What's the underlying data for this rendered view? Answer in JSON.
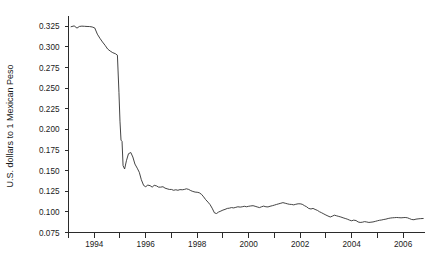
{
  "chart_data": {
    "type": "line",
    "title": "",
    "xlabel": "",
    "ylabel": "U.S. dollars to 1 Mexican Peso",
    "xlim": [
      1993.0,
      2006.85
    ],
    "ylim": [
      0.075,
      0.3375
    ],
    "grid": false,
    "legend": "none",
    "x_ticks": [
      1994,
      1996,
      1998,
      2000,
      2002,
      2004,
      2006
    ],
    "x_tick_labels": [
      "1994",
      "1996",
      "1998",
      "2000",
      "2002",
      "2004",
      "2006"
    ],
    "x_minor_ticks": [
      1993,
      1995,
      1997,
      1999,
      2001,
      2003,
      2005
    ],
    "y_ticks": [
      0.075,
      0.1,
      0.125,
      0.15,
      0.175,
      0.2,
      0.225,
      0.25,
      0.275,
      0.3,
      0.325
    ],
    "y_tick_labels": [
      "0.075",
      "0.100",
      "0.125",
      "0.150",
      "0.175",
      "0.200",
      "0.225",
      "0.250",
      "0.275",
      "0.300",
      "0.325"
    ],
    "line_color": "#2f2f2f",
    "series": [
      {
        "name": "USD per Mexican Peso",
        "x": [
          1993.1,
          1993.22,
          1993.33,
          1993.42,
          1993.52,
          1993.62,
          1993.72,
          1993.82,
          1993.92,
          1994.02,
          1994.12,
          1994.22,
          1994.32,
          1994.42,
          1994.52,
          1994.62,
          1994.72,
          1994.82,
          1994.9,
          1994.96,
          1995.0,
          1995.04,
          1995.08,
          1995.12,
          1995.18,
          1995.25,
          1995.33,
          1995.42,
          1995.5,
          1995.58,
          1995.67,
          1995.75,
          1995.83,
          1995.92,
          1996.0,
          1996.08,
          1996.17,
          1996.25,
          1996.33,
          1996.42,
          1996.5,
          1996.58,
          1996.67,
          1996.75,
          1996.83,
          1996.92,
          1997.0,
          1997.08,
          1997.17,
          1997.25,
          1997.33,
          1997.42,
          1997.5,
          1997.58,
          1997.67,
          1997.75,
          1997.83,
          1997.92,
          1998.0,
          1998.08,
          1998.17,
          1998.25,
          1998.33,
          1998.42,
          1998.5,
          1998.58,
          1998.67,
          1998.75,
          1998.83,
          1998.92,
          1999.0,
          1999.08,
          1999.17,
          1999.25,
          1999.33,
          1999.42,
          1999.5,
          1999.58,
          1999.67,
          1999.75,
          1999.83,
          1999.92,
          2000.0,
          2000.08,
          2000.17,
          2000.25,
          2000.33,
          2000.42,
          2000.5,
          2000.58,
          2000.67,
          2000.75,
          2000.83,
          2000.92,
          2001.0,
          2001.08,
          2001.17,
          2001.25,
          2001.33,
          2001.42,
          2001.5,
          2001.58,
          2001.67,
          2001.75,
          2001.83,
          2001.92,
          2002.0,
          2002.08,
          2002.17,
          2002.25,
          2002.33,
          2002.42,
          2002.5,
          2002.58,
          2002.67,
          2002.75,
          2002.83,
          2002.92,
          2003.0,
          2003.08,
          2003.17,
          2003.25,
          2003.33,
          2003.42,
          2003.5,
          2003.58,
          2003.67,
          2003.75,
          2003.83,
          2003.92,
          2004.0,
          2004.08,
          2004.17,
          2004.25,
          2004.33,
          2004.42,
          2004.5,
          2004.58,
          2004.67,
          2004.75,
          2004.83,
          2004.92,
          2005.0,
          2005.08,
          2005.17,
          2005.25,
          2005.33,
          2005.42,
          2005.5,
          2005.58,
          2005.67,
          2005.75,
          2005.83,
          2005.92,
          2006.0,
          2006.08,
          2006.17,
          2006.25,
          2006.33,
          2006.42,
          2006.5,
          2006.58,
          2006.67,
          2006.78
        ],
        "y": [
          0.3245,
          0.3255,
          0.3228,
          0.3248,
          0.3252,
          0.325,
          0.3248,
          0.3247,
          0.3242,
          0.323,
          0.3155,
          0.3105,
          0.306,
          0.302,
          0.2975,
          0.295,
          0.293,
          0.2918,
          0.29,
          0.245,
          0.21,
          0.187,
          0.1855,
          0.156,
          0.152,
          0.162,
          0.1705,
          0.172,
          0.1665,
          0.158,
          0.153,
          0.148,
          0.139,
          0.132,
          0.1305,
          0.1325,
          0.1318,
          0.13,
          0.1322,
          0.1315,
          0.13,
          0.13,
          0.1305,
          0.1288,
          0.128,
          0.1272,
          0.1272,
          0.1262,
          0.1268,
          0.1262,
          0.127,
          0.1268,
          0.1272,
          0.128,
          0.1272,
          0.1258,
          0.1248,
          0.124,
          0.1238,
          0.1232,
          0.1212,
          0.1182,
          0.1148,
          0.1118,
          0.1088,
          0.1045,
          0.0988,
          0.098,
          0.0998,
          0.101,
          0.1022,
          0.103,
          0.1042,
          0.1045,
          0.1052,
          0.1048,
          0.1055,
          0.1062,
          0.1058,
          0.1062,
          0.1068,
          0.1062,
          0.1068,
          0.1072,
          0.1075,
          0.1068,
          0.106,
          0.1052,
          0.1062,
          0.107,
          0.1062,
          0.106,
          0.1068,
          0.1075,
          0.1082,
          0.109,
          0.1098,
          0.1105,
          0.1112,
          0.1105,
          0.1098,
          0.1092,
          0.109,
          0.1085,
          0.1092,
          0.1098,
          0.1098,
          0.1092,
          0.1075,
          0.1062,
          0.1042,
          0.1035,
          0.1042,
          0.103,
          0.1018,
          0.1002,
          0.099,
          0.0975,
          0.0962,
          0.095,
          0.0938,
          0.0948,
          0.096,
          0.0952,
          0.0945,
          0.0938,
          0.0928,
          0.092,
          0.0912,
          0.09,
          0.0892,
          0.09,
          0.0895,
          0.0878,
          0.0872,
          0.0875,
          0.0882,
          0.0878,
          0.0872,
          0.0875,
          0.0878,
          0.0885,
          0.0892,
          0.0898,
          0.0902,
          0.0908,
          0.0912,
          0.092,
          0.0925,
          0.0928,
          0.093,
          0.0932,
          0.093,
          0.0928,
          0.093,
          0.0932,
          0.0928,
          0.0918,
          0.0908,
          0.0905,
          0.0912,
          0.0915,
          0.0918,
          0.092
        ]
      }
    ]
  }
}
